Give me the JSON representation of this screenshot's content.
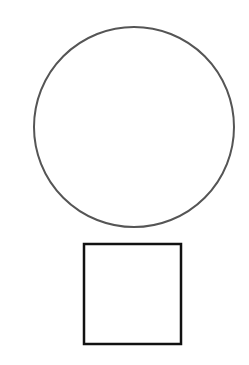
{
  "canvas": {
    "width": 249,
    "height": 365,
    "background": "#ffffff"
  },
  "shapes": [
    {
      "type": "circle",
      "cx": 134,
      "cy": 127,
      "r": 100,
      "stroke": "#555555",
      "stroke_width": 2,
      "fill": "none"
    },
    {
      "type": "square",
      "x": 84,
      "y": 244,
      "width": 97,
      "height": 100,
      "stroke": "#111111",
      "stroke_width": 2.5,
      "fill": "none"
    }
  ]
}
